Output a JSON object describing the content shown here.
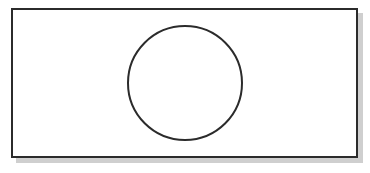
{
  "diagram": {
    "frame": {
      "x": 11,
      "y": 8,
      "width": 345,
      "height": 148,
      "stroke": "#2b2b2b",
      "fill": "#ffffff",
      "shadow": "#cfcfcf"
    },
    "circle": {
      "cx": 185,
      "cy": 83,
      "r": 57,
      "stroke": "#2b2b2b",
      "stroke_width": 2,
      "fill": "none"
    }
  }
}
